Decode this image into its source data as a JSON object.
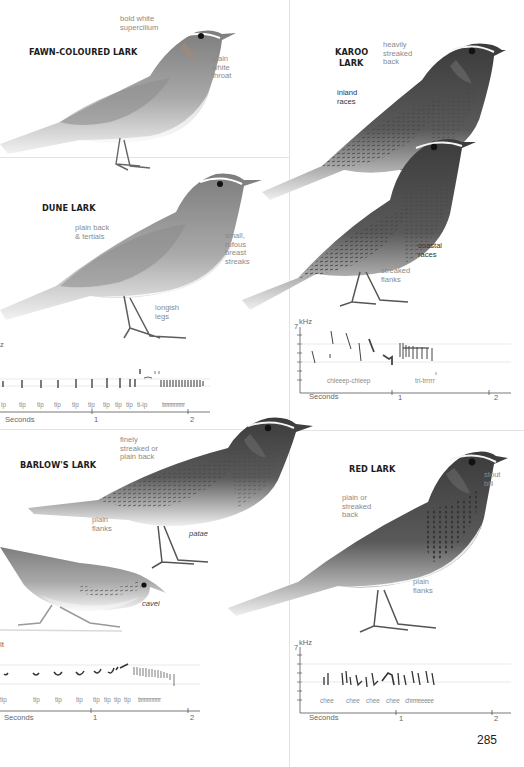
{
  "page": {
    "number": "285",
    "colors": {
      "ink": "#1c1c1c",
      "note": "#8a8a8a",
      "rule": "#e3e3e3",
      "bird_dark": "#3a3a3a",
      "bird_mid": "#8c8c8c",
      "bird_light": "#d9d9d9"
    }
  },
  "species": [
    {
      "id": "fawn-coloured-lark",
      "name": "FAWN-COLOURED LARK",
      "notes": [
        {
          "text": "bold white\nsupercilium"
        },
        {
          "text": "plain\nwhite\nthroat"
        }
      ]
    },
    {
      "id": "karoo-lark",
      "name": "KAROO\nLARK",
      "name_lines": [
        "KAROO",
        "LARK"
      ],
      "notes": [
        {
          "text": "heavily\nstreaked\nback"
        },
        {
          "text": "inland\nraces"
        },
        {
          "text": "coastal\nraces"
        },
        {
          "text": "streaked\nflanks"
        }
      ]
    },
    {
      "id": "dune-lark",
      "name": "DUNE LARK",
      "notes": [
        {
          "text": "plain back\n& tertials"
        },
        {
          "text": "small,\nrufous\nbreast\nstreaks"
        },
        {
          "text": "longish\nlegs"
        }
      ]
    },
    {
      "id": "barlows-lark",
      "name": "BARLOW'S LARK",
      "notes": [
        {
          "text": "finely\nstreaked or\nplain back"
        },
        {
          "text": "plain\nflanks"
        },
        {
          "text": "patae"
        },
        {
          "text": "cavei"
        }
      ]
    },
    {
      "id": "red-lark",
      "name": "RED LARK",
      "notes": [
        {
          "text": "stout\nbill"
        },
        {
          "text": "plain or\nstreaked\nback"
        },
        {
          "text": "plain\nflanks"
        }
      ]
    }
  ],
  "sonograms": {
    "dune": {
      "unit": "z",
      "syllables": [
        "ip",
        "tip",
        "tip",
        "tip",
        "tip",
        "tip",
        "tip",
        "tip",
        "tip",
        "ti-ip",
        "trrrrrrrrrrrrrr"
      ],
      "axis_label": "Seconds",
      "ticks": [
        "1",
        "2"
      ]
    },
    "karoo": {
      "unit": "kHz",
      "ymax": "7",
      "syllables": [
        "chleeep-chleep",
        "tri-trrrrr"
      ],
      "axis_label": "Seconds",
      "ticks": [
        "1",
        "2"
      ]
    },
    "barlows": {
      "unit": "lt",
      "syllables": [
        "tip",
        "tip",
        "tip",
        "tip",
        "tip",
        "tip",
        "tip",
        "tip",
        "trrrrrrrrrrrrrr"
      ],
      "axis_label": "Seconds",
      "ticks": [
        "1",
        "2"
      ]
    },
    "red": {
      "unit": "kHz",
      "ymax": "7",
      "syllables": [
        "chee",
        "chee",
        "chee",
        "chee",
        "chrrrreeeee"
      ],
      "axis_label": "Seconds",
      "ticks": [
        "1",
        "2"
      ]
    }
  }
}
